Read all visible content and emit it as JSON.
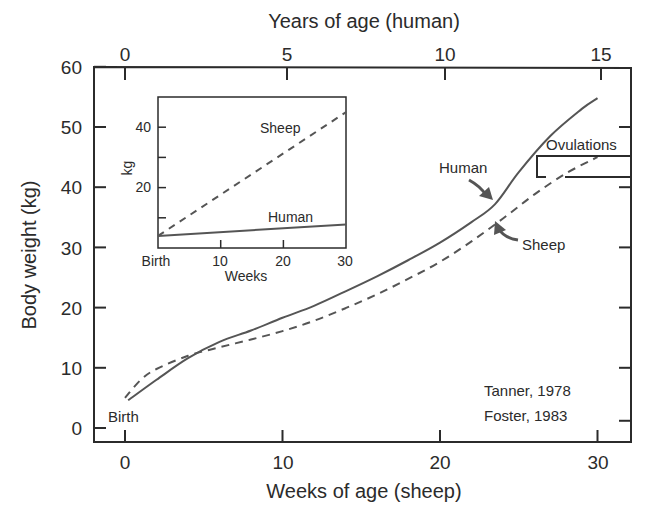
{
  "chart_data": {
    "type": "line",
    "title": "",
    "xlabel": "Weeks of age (sheep)",
    "x2label": "Years of age (human)",
    "ylabel": "Body weight (kg)",
    "xlim": [
      -2,
      32
    ],
    "ylim": [
      -1,
      60
    ],
    "xticks": [
      0,
      10,
      20,
      30
    ],
    "x2ticks": [
      0,
      5,
      10,
      15
    ],
    "yticks": [
      0,
      10,
      20,
      30,
      40,
      50,
      60
    ],
    "grid": false,
    "series": [
      {
        "name": "Human",
        "style": "solid",
        "x_unit": "weeks-equivalent (1 human year = 2 sheep weeks)",
        "x": [
          0.2,
          2,
          4,
          6,
          8,
          10,
          12,
          14,
          16,
          18,
          20,
          22,
          23.5,
          25,
          27,
          29,
          30
        ],
        "values": [
          4.6,
          8,
          11.6,
          14.3,
          16.2,
          18.3,
          20.3,
          22.7,
          25.2,
          27.9,
          30.8,
          34.2,
          37.2,
          42.5,
          48.5,
          53,
          54.8
        ]
      },
      {
        "name": "Sheep",
        "style": "dashed",
        "x": [
          0,
          1,
          2,
          4,
          6,
          8,
          10,
          12,
          14,
          16,
          18,
          20,
          22,
          24,
          26,
          28,
          30
        ],
        "values": [
          5,
          8,
          9.8,
          12,
          13.4,
          14.7,
          16.1,
          17.8,
          19.9,
          22.2,
          24.8,
          27.6,
          31,
          34.8,
          38.8,
          42.3,
          45
        ]
      }
    ],
    "annotations": [
      {
        "text": "Birth",
        "x": 0,
        "y": 2
      },
      {
        "text": "Human",
        "arrow_to": [
          23.5,
          37.2
        ]
      },
      {
        "text": "Sheep",
        "arrow_to": [
          23.5,
          34.5
        ]
      },
      {
        "text": "Ovulations",
        "bracket_y": [
          41.5,
          45
        ],
        "bracket_x_start": 26.3
      },
      {
        "text": "Tanner, 1978"
      },
      {
        "text": "Foster, 1983"
      }
    ],
    "inset": {
      "type": "line",
      "xlabel": "Weeks",
      "ylabel": "kg",
      "xticks": [
        "Birth",
        "10",
        "20",
        "30"
      ],
      "yticks": [
        20,
        40
      ],
      "xlim": [
        0,
        30
      ],
      "ylim": [
        0,
        50
      ],
      "series": [
        {
          "name": "Sheep",
          "style": "dashed",
          "x": [
            0,
            30
          ],
          "values": [
            4,
            45
          ]
        },
        {
          "name": "Human",
          "style": "solid",
          "x": [
            0,
            30
          ],
          "values": [
            4,
            7.8
          ]
        }
      ]
    }
  },
  "labels": {
    "x_title": "Weeks of age (sheep)",
    "x2_title": "Years of age (human)",
    "y_title": "Body weight (kg)",
    "x_ticks": [
      "0",
      "10",
      "20",
      "30"
    ],
    "x2_ticks": [
      "0",
      "5",
      "10",
      "15"
    ],
    "y_ticks": [
      "0",
      "10",
      "20",
      "30",
      "40",
      "50",
      "60"
    ],
    "birth": "Birth",
    "human": "Human",
    "sheep": "Sheep",
    "ovulations": "Ovulations",
    "source1": "Tanner, 1978",
    "source2": "Foster, 1983",
    "inset_ylabel": "kg",
    "inset_xlabel": "Weeks",
    "inset_x_ticks": [
      "Birth",
      "10",
      "20",
      "30"
    ],
    "inset_y_ticks": [
      "20",
      "40"
    ],
    "inset_sheep": "Sheep",
    "inset_human": "Human"
  },
  "colors": {
    "ink": "#2b2b2b",
    "curve": "#555555",
    "background": "#ffffff"
  }
}
